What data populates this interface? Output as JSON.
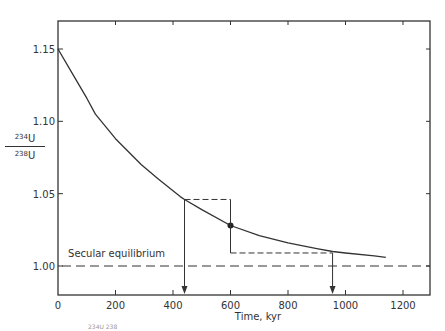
{
  "chart_data": {
    "type": "line",
    "title": "",
    "xlabel": "Time, kyr",
    "ylabel": "234U/238U",
    "ylabel_parts": {
      "num_sup": "234",
      "num_sym": "U",
      "den_sup": "238",
      "den_sym": "U"
    },
    "xlim": [
      0,
      1300
    ],
    "ylim": [
      0.975,
      1.17
    ],
    "x_ticks": [
      0,
      200,
      400,
      600,
      800,
      1000,
      1200
    ],
    "x_tick_labels": [
      "0",
      "200",
      "400",
      "600",
      "800",
      "1000",
      "1200"
    ],
    "y_ticks": [
      1.0,
      1.05,
      1.1,
      1.15
    ],
    "y_tick_labels": [
      "1.00",
      "1.05",
      "1.10",
      "1.15"
    ],
    "grid": false,
    "legend": null,
    "series": [
      {
        "name": "234U/238U decay curve",
        "style": "solid",
        "x": [
          0,
          50,
          100,
          130,
          200,
          290,
          350,
          425,
          440,
          500,
          600,
          700,
          800,
          900,
          955,
          1000,
          1100,
          1140
        ],
        "y": [
          1.15,
          1.133,
          1.116,
          1.105,
          1.088,
          1.07,
          1.06,
          1.048,
          1.046,
          1.039,
          1.028,
          1.021,
          1.016,
          1.012,
          1.01,
          1.009,
          1.007,
          1.006
        ]
      },
      {
        "name": "Secular equilibrium",
        "style": "dashed",
        "x": [
          0,
          1300
        ],
        "y": [
          1.0,
          1.0
        ]
      }
    ],
    "annotations": [
      {
        "type": "text",
        "text": "Secular equilibrium",
        "x": 35,
        "y": 1.006
      },
      {
        "type": "point",
        "label": "measured sample",
        "x": 600,
        "y": 1.028
      },
      {
        "type": "dashed-segment",
        "from": [
          440,
          1.046
        ],
        "to": [
          600,
          1.046
        ]
      },
      {
        "type": "solid-segment",
        "from": [
          600,
          1.046
        ],
        "to": [
          600,
          1.009
        ]
      },
      {
        "type": "dashed-segment",
        "from": [
          600,
          1.009
        ],
        "to": [
          955,
          1.009
        ]
      },
      {
        "type": "arrow",
        "from": [
          440,
          1.046
        ],
        "to": [
          440,
          0.975
        ],
        "label_x": 440
      },
      {
        "type": "arrow",
        "from": [
          955,
          1.009
        ],
        "to": [
          955,
          0.975
        ],
        "label_x": 955
      }
    ]
  },
  "caption_fragment": "234U   238"
}
